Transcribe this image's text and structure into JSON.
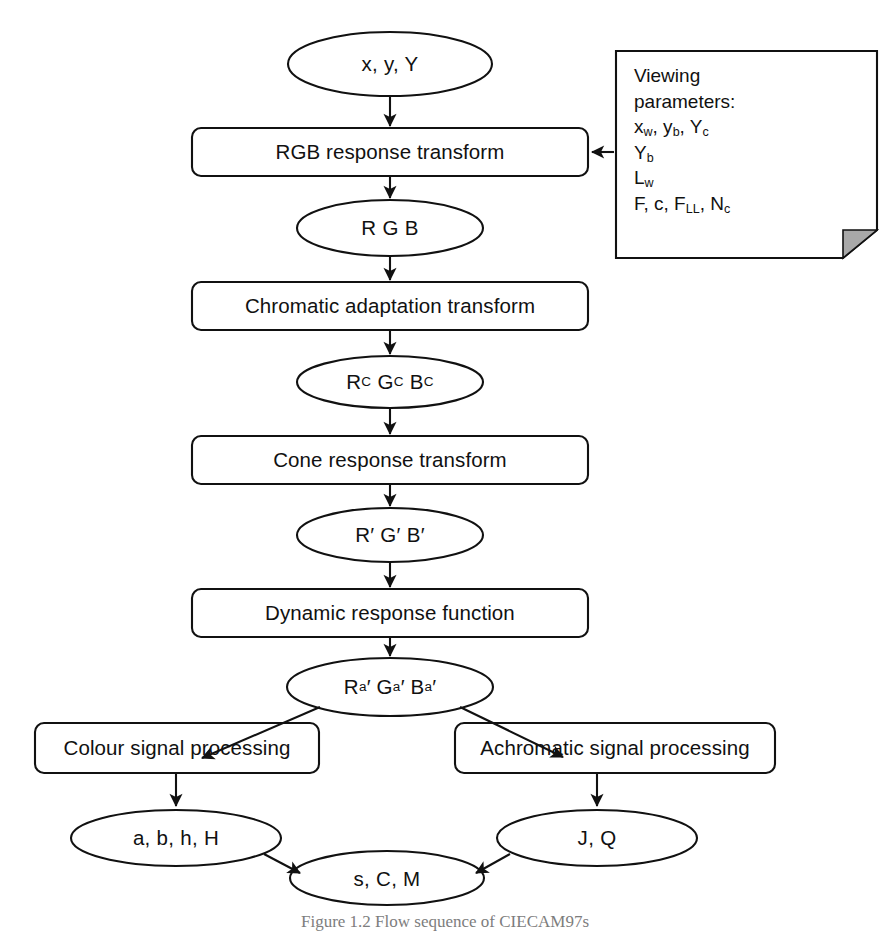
{
  "figure": {
    "caption": "Figure 1.2   Flow sequence of CIECAM97s",
    "stroke_color": "#111111",
    "fill_color": "#ffffff",
    "fold_fill_color": "#a8a8a8"
  },
  "nodes": {
    "input_ellipse": "x, y, Y",
    "box_rgb_response": "RGB response transform",
    "ellipse_rgb": "R G B",
    "box_chromatic_adaptation": "Chromatic adaptation transform",
    "ellipse_rgb_c": "RC GC BC",
    "box_cone_response": "Cone response transform",
    "ellipse_rgb_prime": "R′ G′ B′",
    "box_dynamic_response": "Dynamic response function",
    "ellipse_rgb_a_prime": "Rₐ′ Gₐ′ Bₐ′",
    "box_colour_signal": "Colour signal processing",
    "box_achromatic_signal": "Achromatic signal processing",
    "ellipse_abhH": "a, b, h, H",
    "ellipse_JQ": "J, Q",
    "ellipse_sCM": "s, C, M"
  },
  "note": {
    "title_line1": "Viewing",
    "title_line2": "parameters:",
    "params": [
      "xᵥᵥ, yb, Yc",
      "Yb",
      "Lw",
      "F, c, FLL, Nc"
    ],
    "param_rows": [
      [
        {
          "base": "x",
          "sub": "w"
        },
        {
          "base": ", y",
          "sub": "b"
        },
        {
          "base": ", Y",
          "sub": "c"
        }
      ],
      [
        {
          "base": "Y",
          "sub": "b"
        }
      ],
      [
        {
          "base": "L",
          "sub": "w"
        }
      ],
      [
        {
          "base": "F, c, F",
          "sub": "LL"
        },
        {
          "base": ", N",
          "sub": "c"
        }
      ]
    ]
  }
}
